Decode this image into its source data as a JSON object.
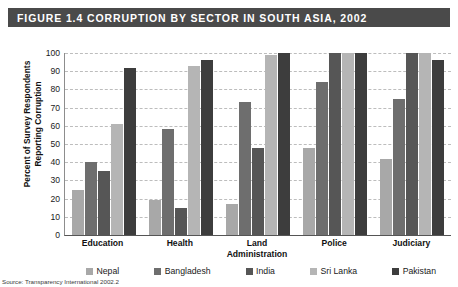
{
  "figure": {
    "title": "FIGURE 1.4 CORRUPTION BY SECTOR IN SOUTH ASIA, 2002",
    "source_note": "Source: Transparency International 2002.2",
    "title_bar_color": "#4a4a4a",
    "title_text_color": "#ffffff"
  },
  "chart_data": {
    "type": "bar",
    "title": "FIGURE 1.4 CORRUPTION BY SECTOR IN SOUTH ASIA, 2002",
    "xlabel": "",
    "ylabel": "Percent of Survey Respondents\nReporting Corruption",
    "ylim": [
      0,
      100
    ],
    "yticks": [
      0,
      10,
      20,
      30,
      40,
      50,
      60,
      70,
      80,
      90,
      100
    ],
    "grid": true,
    "legend_position": "bottom",
    "categories": [
      "Education",
      "Health",
      "Land\nAdministration",
      "Police",
      "Judiciary"
    ],
    "series": [
      {
        "name": "Nepal",
        "color": "#a8a8a8",
        "values": [
          25,
          19,
          17,
          48,
          42
        ]
      },
      {
        "name": "Bangladesh",
        "color": "#6e6e6e",
        "values": [
          40,
          58,
          73,
          84,
          75
        ]
      },
      {
        "name": "India",
        "color": "#565656",
        "values": [
          35,
          15,
          48,
          100,
          100
        ]
      },
      {
        "name": "Sri Lanka",
        "color": "#b5b5b5",
        "values": [
          61,
          93,
          99,
          100,
          100
        ]
      },
      {
        "name": "Pakistan",
        "color": "#3d3d3d",
        "values": [
          92,
          96,
          100,
          100,
          96
        ]
      }
    ]
  }
}
